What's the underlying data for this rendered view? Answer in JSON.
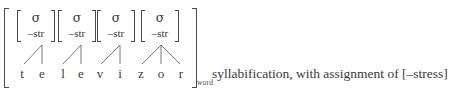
{
  "figure": {
    "outer_bracket_subscript": "word",
    "syllables": [
      {
        "node": "σ",
        "feature": "–str"
      },
      {
        "node": "σ",
        "feature": "–str"
      },
      {
        "node": "σ",
        "feature": "–str"
      },
      {
        "node": "σ",
        "feature": "–str"
      }
    ],
    "segments": [
      "t",
      "e",
      "l",
      "e",
      "v",
      "i",
      "z",
      "o",
      "r"
    ],
    "word": "televizor",
    "caption": "syllabification, with assignment of [–stress]",
    "colors": {
      "ink": "#3a3a3a",
      "rule": "#4a4a4a",
      "background": "#ffffff"
    }
  }
}
